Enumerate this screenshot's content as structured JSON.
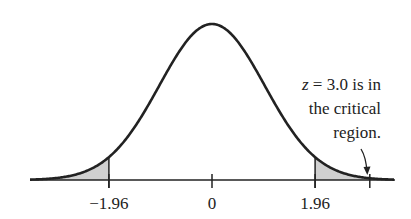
{
  "chart_data": {
    "type": "area",
    "title": "",
    "xlabel": "",
    "ylabel": "",
    "distribution": "standard normal",
    "x_range": [
      -3.46,
      3.46
    ],
    "ticks": [
      {
        "value": -1.96,
        "label": "-1.96"
      },
      {
        "value": 0,
        "label": "0"
      },
      {
        "value": 1.96,
        "label": "1.96"
      },
      {
        "value": 3.0,
        "label": ""
      }
    ],
    "shaded_regions": [
      {
        "from": -3.46,
        "to": -1.96,
        "label": "lower critical region"
      },
      {
        "from": 1.96,
        "to": 3.46,
        "label": "upper critical region"
      }
    ],
    "annotation": {
      "text_line1_var": "z",
      "text_line1_rest": " = 3.0 is in",
      "text_line2": "the critical",
      "text_line3": "region.",
      "points_to": 3.0
    },
    "grid": false,
    "legend": null
  },
  "colors": {
    "curve": "#222222",
    "shade": "#d0d0d0",
    "axis": "#222222"
  }
}
